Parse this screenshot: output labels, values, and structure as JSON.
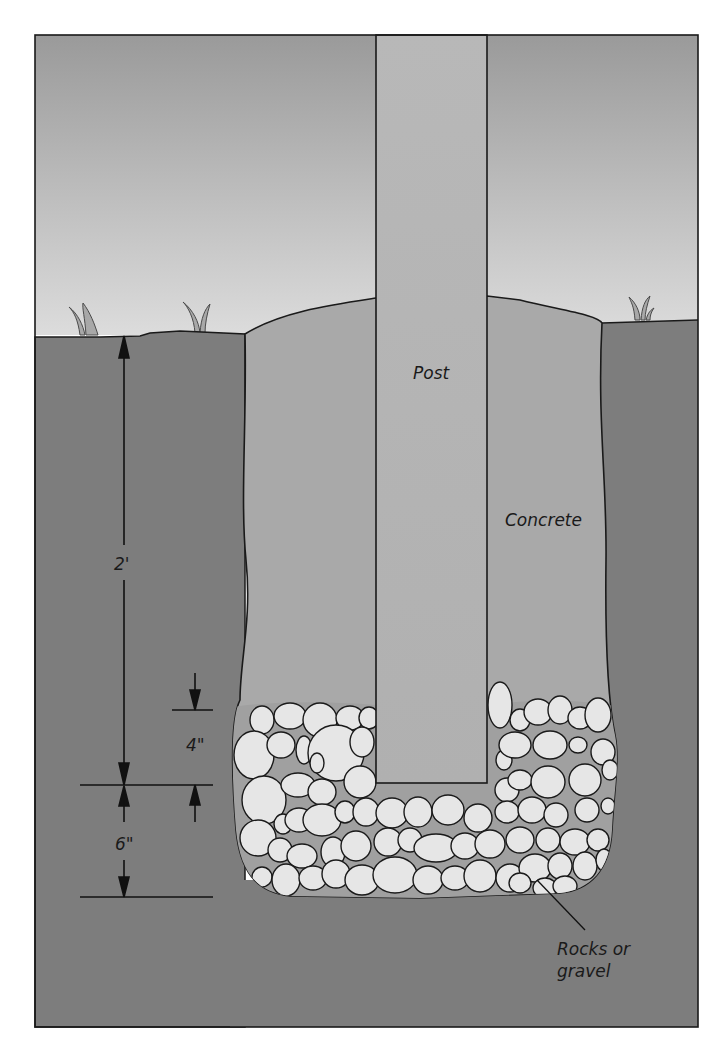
{
  "diagram": {
    "labels": {
      "post": "Post",
      "concrete": "Concrete",
      "rocks_line1": "Rocks or",
      "rocks_line2": "gravel"
    },
    "dimensions": {
      "hole_depth": "2'",
      "post_embed_above_bottom": "4\"",
      "gravel_depth": "6\""
    },
    "colors": {
      "sky_top": "#9a9a9a",
      "sky_horizon": "#dcdcdc",
      "ground": "#7d7d7d",
      "concrete": "#a9a9a9",
      "post": "#b5b5b5",
      "rock_fill": "#e6e6e6",
      "gravel_fill": "#a0a0a0",
      "outline": "#1a1a1a"
    },
    "rocks": [
      [
        262,
        720,
        12,
        14
      ],
      [
        290,
        716,
        16,
        13
      ],
      [
        320,
        720,
        17,
        17
      ],
      [
        350,
        718,
        14,
        12
      ],
      [
        369,
        718,
        10,
        11
      ],
      [
        254,
        755,
        20,
        24
      ],
      [
        281,
        745,
        14,
        13
      ],
      [
        304,
        750,
        8,
        14
      ],
      [
        336,
        753,
        28,
        28
      ],
      [
        362,
        742,
        12,
        15
      ],
      [
        264,
        800,
        22,
        24
      ],
      [
        298,
        785,
        17,
        12
      ],
      [
        317,
        763,
        7,
        10
      ],
      [
        322,
        792,
        14,
        13
      ],
      [
        360,
        782,
        16,
        16
      ],
      [
        258,
        838,
        18,
        18
      ],
      [
        283,
        824,
        9,
        10
      ],
      [
        299,
        820,
        14,
        12
      ],
      [
        322,
        820,
        19,
        16
      ],
      [
        345,
        812,
        10,
        11
      ],
      [
        366,
        812,
        13,
        14
      ],
      [
        280,
        850,
        12,
        12
      ],
      [
        302,
        856,
        15,
        12
      ],
      [
        333,
        852,
        12,
        15
      ],
      [
        356,
        846,
        15,
        15
      ],
      [
        262,
        877,
        10,
        10
      ],
      [
        286,
        880,
        14,
        16
      ],
      [
        313,
        878,
        14,
        12
      ],
      [
        336,
        874,
        14,
        14
      ],
      [
        362,
        880,
        17,
        15
      ],
      [
        392,
        813,
        16,
        15
      ],
      [
        418,
        812,
        14,
        15
      ],
      [
        448,
        810,
        16,
        15
      ],
      [
        478,
        818,
        14,
        14
      ],
      [
        388,
        842,
        14,
        14
      ],
      [
        410,
        840,
        12,
        12
      ],
      [
        436,
        848,
        22,
        14
      ],
      [
        465,
        846,
        14,
        13
      ],
      [
        490,
        844,
        15,
        14
      ],
      [
        395,
        875,
        22,
        18
      ],
      [
        428,
        880,
        15,
        14
      ],
      [
        455,
        878,
        14,
        12
      ],
      [
        480,
        876,
        16,
        16
      ],
      [
        510,
        878,
        14,
        14
      ],
      [
        500,
        705,
        12,
        23
      ],
      [
        520,
        720,
        10,
        11
      ],
      [
        538,
        712,
        14,
        13
      ],
      [
        560,
        710,
        12,
        14
      ],
      [
        580,
        718,
        12,
        11
      ],
      [
        598,
        715,
        13,
        17
      ],
      [
        504,
        760,
        8,
        10
      ],
      [
        515,
        745,
        16,
        13
      ],
      [
        550,
        745,
        17,
        14
      ],
      [
        578,
        745,
        9,
        8
      ],
      [
        603,
        752,
        12,
        13
      ],
      [
        507,
        790,
        12,
        12
      ],
      [
        520,
        780,
        12,
        10
      ],
      [
        548,
        782,
        17,
        16
      ],
      [
        585,
        780,
        16,
        16
      ],
      [
        610,
        770,
        8,
        10
      ],
      [
        507,
        812,
        12,
        11
      ],
      [
        532,
        810,
        14,
        13
      ],
      [
        556,
        815,
        12,
        12
      ],
      [
        587,
        810,
        12,
        12
      ],
      [
        608,
        806,
        7,
        8
      ],
      [
        520,
        840,
        14,
        13
      ],
      [
        548,
        840,
        12,
        12
      ],
      [
        575,
        842,
        15,
        13
      ],
      [
        598,
        840,
        11,
        11
      ],
      [
        535,
        868,
        16,
        14
      ],
      [
        560,
        866,
        12,
        13
      ],
      [
        585,
        866,
        12,
        14
      ],
      [
        604,
        860,
        8,
        11
      ],
      [
        520,
        883,
        11,
        10
      ],
      [
        545,
        888,
        12,
        10
      ],
      [
        565,
        886,
        12,
        10
      ]
    ]
  }
}
